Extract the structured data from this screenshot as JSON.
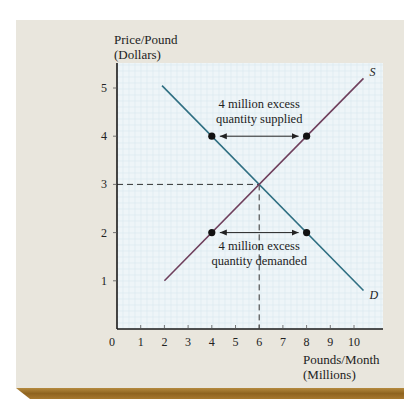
{
  "chart_data": {
    "type": "line",
    "title": "",
    "ylabel": "Price/Pound (Dollars)",
    "ylabel_lines": [
      "Price/Pound",
      "(Dollars)"
    ],
    "xlabel": "Pounds/Month (Millions)",
    "xlabel_lines": [
      "Pounds/Month",
      "(Millions)"
    ],
    "xlim": [
      0,
      11.2
    ],
    "ylim": [
      0,
      5.5
    ],
    "x_ticks": [
      0,
      1,
      2,
      3,
      4,
      5,
      6,
      7,
      8,
      9,
      10
    ],
    "y_ticks": [
      1,
      2,
      3,
      4,
      5
    ],
    "grid": true,
    "series": [
      {
        "name": "D",
        "label": "D",
        "color": "#2f6f82",
        "points": [
          [
            1.9,
            5.05
          ],
          [
            10.4,
            0.8
          ]
        ]
      },
      {
        "name": "S",
        "label": "S",
        "color": "#6e3f5c",
        "points": [
          [
            2.0,
            1.0
          ],
          [
            10.4,
            5.2
          ]
        ]
      }
    ],
    "equilibrium": {
      "x": 6,
      "y": 3
    },
    "markers": [
      {
        "x": 4,
        "y": 4
      },
      {
        "x": 8,
        "y": 4
      },
      {
        "x": 4,
        "y": 2
      },
      {
        "x": 8,
        "y": 2
      }
    ],
    "annotations": [
      {
        "lines": [
          "4 million excess",
          "quantity supplied"
        ],
        "arrow_from": [
          4,
          4
        ],
        "arrow_to": [
          8,
          4
        ]
      },
      {
        "lines": [
          "4 million excess",
          "quantity demanded"
        ],
        "arrow_from": [
          4,
          2
        ],
        "arrow_to": [
          8,
          2
        ]
      }
    ]
  },
  "colors": {
    "card": "#e9e6dd",
    "plot_bg": "#eef5f8",
    "grid": "#d9e8ef",
    "axis": "#1a1a1a",
    "gold": "#9a6d28"
  }
}
